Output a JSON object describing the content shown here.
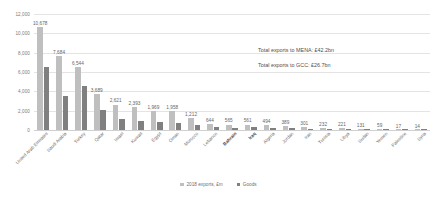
{
  "chart_data": {
    "type": "bar",
    "title": "",
    "subtitle": "",
    "xlabel": "",
    "ylabel": "",
    "ylim": [
      0,
      12000
    ],
    "ytick_labels": [
      "12,000",
      "10,000",
      "8,000",
      "6,000",
      "4,000",
      "2,000",
      "0"
    ],
    "yticks": [
      12000,
      10000,
      8000,
      6000,
      4000,
      2000,
      0
    ],
    "grid": true,
    "legend_position": "bottom",
    "categories": [
      "United Arab Emirates",
      "Saudi Arabia",
      "Turkey",
      "Qatar",
      "Israel",
      "Kuwait",
      "Egypt",
      "Oman",
      "Morocco",
      "Lebanon",
      "Bahrain",
      "Iraq",
      "Algeria",
      "Jordan",
      "Iran",
      "Tunisia",
      "Libya",
      "Sudan",
      "Yemen",
      "Palestine",
      "Syria"
    ],
    "bold_categories": [
      "Bahrain",
      "Iraq"
    ],
    "series": [
      {
        "name": "2018 exports, £m",
        "color": "#bfbfbf",
        "values": [
          10678,
          7684,
          6544,
          3689,
          2621,
          2393,
          1969,
          1958,
          1212,
          644,
          565,
          561,
          494,
          389,
          301,
          232,
          221,
          131,
          59,
          17,
          14
        ]
      },
      {
        "name": "Goods",
        "color": "#808080",
        "values": [
          6540,
          3530,
          4560,
          2100,
          1180,
          900,
          860,
          700,
          520,
          300,
          250,
          330,
          230,
          170,
          140,
          110,
          120,
          70,
          30,
          9,
          8
        ]
      }
    ],
    "data_labels": [
      "10,678",
      "7,684",
      "6,544",
      "3,689",
      "2,621",
      "2,393",
      "1,969",
      "1,958",
      "1,212",
      "644",
      "565",
      "561",
      "494",
      "389",
      "301",
      "232",
      "221",
      "131",
      "59",
      "17",
      "14"
    ],
    "annotations": [
      "Total exports to MENA: £42.2bn",
      "Total exports to GCC: £26.7bn"
    ]
  },
  "legend": {
    "items": [
      {
        "label": "2018 exports, £m",
        "color": "#bfbfbf"
      },
      {
        "label": "Goods",
        "color": "#808080"
      }
    ]
  }
}
